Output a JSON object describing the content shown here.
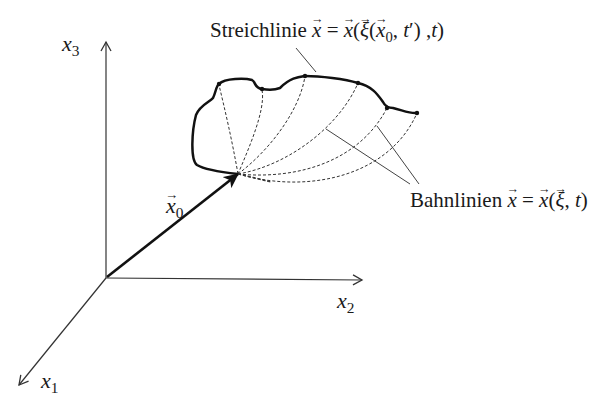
{
  "diagram": {
    "type": "3D coordinate sketch: streakline vs pathlines",
    "axes": {
      "x1": {
        "label": "x",
        "subscript": "1"
      },
      "x2": {
        "label": "x",
        "subscript": "2"
      },
      "x3": {
        "label": "x",
        "subscript": "3"
      }
    },
    "position_vector": {
      "label": "x",
      "subscript": "0",
      "description": "vector from origin to release point"
    },
    "streakline_label": {
      "word": "Streichlinie",
      "formula": "x = x(ξ(x0, t′), t)"
    },
    "pathlines_label": {
      "word": "Bahnlinien",
      "formula": "x = x(ξ, t)"
    },
    "pathline_count": 7,
    "colors": {
      "ink": "#1a1a1a",
      "axis": "#333333",
      "background": "#ffffff"
    }
  }
}
